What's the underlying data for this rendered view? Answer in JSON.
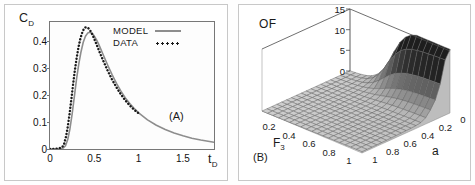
{
  "figure": {
    "panel_a_tag": "(A)",
    "panel_b_tag": "(B)"
  },
  "panel_a": {
    "ylabel": "C",
    "ylabel_sub": "D",
    "xlabel": "t",
    "xlabel_sub": "D",
    "yticks": [
      "0",
      "0.1",
      "0.2",
      "0.3",
      "0.4"
    ],
    "ytick_values": [
      0,
      0.1,
      0.2,
      0.3,
      0.4
    ],
    "xticks": [
      "0",
      "0.5",
      "1",
      "1.5"
    ],
    "xtick_values": [
      0,
      0.5,
      1,
      1.5
    ],
    "legend": [
      {
        "label": "MODEL",
        "style": "solid",
        "color": "#8d8d8d"
      },
      {
        "label": "DATA",
        "style": "dotted",
        "color": "#1a1a1a"
      }
    ]
  },
  "panel_b": {
    "zlabel": "OF",
    "xlabel": "F",
    "xlabel_sub": "3",
    "ylabel": "a",
    "zticks": [
      "0",
      "5",
      "10",
      "15"
    ],
    "ztick_values": [
      0,
      5,
      10,
      15
    ],
    "xticks": [
      "0.2",
      "0.4",
      "0.6",
      "0.8",
      "1"
    ],
    "xtick_values": [
      0.2,
      0.4,
      0.6,
      0.8,
      1
    ],
    "yticks": [
      "0",
      "0.2",
      "0.4",
      "0.6",
      "0.8",
      "1"
    ],
    "ytick_values": [
      0,
      0.2,
      0.4,
      0.6,
      0.8,
      1
    ]
  },
  "chart_data": [
    {
      "type": "line",
      "panel": "A",
      "title": "",
      "xlabel": "tD",
      "ylabel": "CD",
      "xlim": [
        0,
        1.85
      ],
      "ylim": [
        0,
        0.47
      ],
      "grid": false,
      "legend_position": "upper-right",
      "series": [
        {
          "name": "MODEL",
          "style": "solid",
          "color": "#8d8d8d",
          "x": [
            0,
            0.05,
            0.1,
            0.15,
            0.175,
            0.2,
            0.225,
            0.25,
            0.275,
            0.3,
            0.325,
            0.35,
            0.375,
            0.4,
            0.425,
            0.45,
            0.475,
            0.5,
            0.525,
            0.55,
            0.6,
            0.65,
            0.7,
            0.75,
            0.8,
            0.85,
            0.9,
            0.95,
            1.0,
            1.1,
            1.2,
            1.3,
            1.4,
            1.5,
            1.6,
            1.7,
            1.8,
            1.85
          ],
          "y": [
            0,
            0,
            0.001,
            0.004,
            0.012,
            0.035,
            0.075,
            0.13,
            0.195,
            0.26,
            0.315,
            0.36,
            0.395,
            0.417,
            0.429,
            0.432,
            0.428,
            0.418,
            0.404,
            0.387,
            0.349,
            0.311,
            0.275,
            0.243,
            0.214,
            0.189,
            0.168,
            0.15,
            0.134,
            0.108,
            0.088,
            0.072,
            0.059,
            0.049,
            0.04,
            0.033,
            0.028,
            0.025
          ]
        },
        {
          "name": "DATA",
          "style": "dotted",
          "color": "#1a1a1a",
          "x": [
            0,
            0.05,
            0.1,
            0.14,
            0.16,
            0.18,
            0.2,
            0.22,
            0.24,
            0.26,
            0.28,
            0.3,
            0.32,
            0.34,
            0.36,
            0.38,
            0.4,
            0.42,
            0.44,
            0.46,
            0.48,
            0.5,
            0.52,
            0.55,
            0.6,
            0.65,
            0.7,
            0.75,
            0.8,
            0.85,
            0.9,
            0.95,
            1.0
          ],
          "y": [
            0,
            0,
            0.002,
            0.008,
            0.02,
            0.045,
            0.082,
            0.128,
            0.182,
            0.238,
            0.29,
            0.336,
            0.375,
            0.405,
            0.428,
            0.443,
            0.45,
            0.45,
            0.445,
            0.435,
            0.422,
            0.407,
            0.391,
            0.366,
            0.327,
            0.29,
            0.257,
            0.228,
            0.202,
            0.18,
            0.161,
            0.145,
            0.132
          ]
        }
      ]
    },
    {
      "type": "surface",
      "panel": "B",
      "title": "",
      "xlabel": "F3",
      "ylabel": "a",
      "zlabel": "OF",
      "xlim": [
        0,
        1
      ],
      "ylim": [
        0,
        1
      ],
      "zlim": [
        0,
        15
      ],
      "grid": true,
      "description": "Objective function surface, nearly flat and low over most of the F3-a domain, rising into a steep dark ridge/wall near the a = 0 edge at mid-to-high F3.",
      "nx": 18,
      "ny": 18
    }
  ]
}
